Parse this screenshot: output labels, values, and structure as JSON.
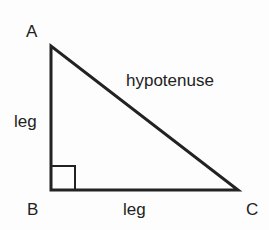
{
  "diagram": {
    "vertices": {
      "A": {
        "label": "A",
        "x": 51,
        "y": 46
      },
      "B": {
        "label": "B",
        "x": 51,
        "y": 190
      },
      "C": {
        "label": "C",
        "x": 238,
        "y": 190
      }
    },
    "sides": {
      "vertical_leg": "leg",
      "horizontal_leg": "leg",
      "hypotenuse": "hypotenuse"
    },
    "right_angle_at": "B",
    "colors": {
      "stroke": "#222222",
      "text": "#222222"
    }
  }
}
